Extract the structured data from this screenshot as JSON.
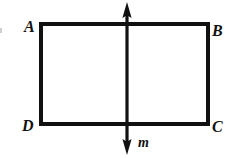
{
  "figure": {
    "background_color": "#ffffff",
    "stroke_color": "#111111",
    "canvas": {
      "width": 245,
      "height": 158
    },
    "rectangle": {
      "name": "rectangle-ABCD",
      "left": 41,
      "right": 208,
      "top": 24,
      "bottom": 124,
      "stroke_width": 4
    },
    "line_m": {
      "name": "line-m",
      "x": 127,
      "y_top": 2,
      "y_bottom": 155,
      "stroke_width": 3,
      "arrowheads": "both",
      "arrowhead_width": 9,
      "arrowhead_height": 14
    },
    "labels": {
      "top_left": "A",
      "top_right": "B",
      "bottom_right": "C",
      "bottom_left": "D",
      "line": "m"
    }
  }
}
